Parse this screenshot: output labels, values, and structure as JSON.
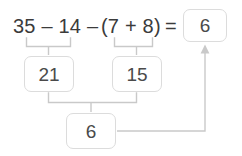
{
  "canvas": {
    "width": 242,
    "height": 156,
    "background": "#ffffff"
  },
  "colors": {
    "text": "#3b3b3b",
    "box_text": "#4a4a4a",
    "box_border": "#dcdcdc",
    "box_fill": "#ffffff",
    "connector": "#c9c9c9"
  },
  "equation": {
    "full_text": "35 – 14 – (7 + 8) = 6",
    "left_term": "35 – 14 – ",
    "right_term": "(7 + 8)",
    "equals": "=",
    "answer_value": "6"
  },
  "boxes": {
    "answer": {
      "value": "6",
      "label": "answer-box"
    },
    "left_partial": {
      "value": "21",
      "label": "partial-result-left"
    },
    "right_partial": {
      "value": "15",
      "label": "partial-result-right"
    },
    "total": {
      "value": "6",
      "label": "final-result"
    }
  },
  "connectors": {
    "bracket_left": "bracket under 35 – 14 pointing to box 21",
    "bracket_right": "bracket under (7 + 8) pointing to box 15",
    "bracket_join": "bracket joining 21 and 15 pointing to box 6",
    "arrow": "arrow from box 6 up to answer box 6"
  }
}
